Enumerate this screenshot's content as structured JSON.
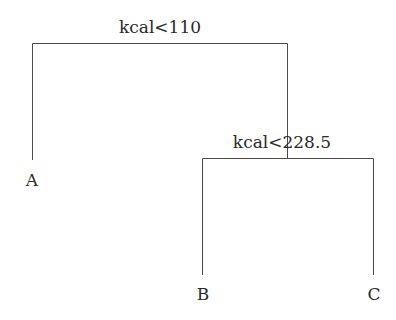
{
  "tree": {
    "root": {
      "split_label": "kcal<110"
    },
    "node2": {
      "split_label": "kcal<228.5"
    },
    "leaves": [
      {
        "label": "A"
      },
      {
        "label": "B"
      },
      {
        "label": "C"
      }
    ]
  },
  "colors": {
    "line": "#444444",
    "text": "#2a2a2a",
    "background": "#ffffff"
  }
}
